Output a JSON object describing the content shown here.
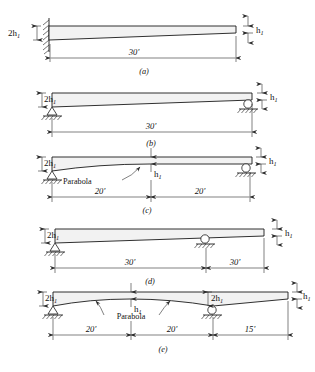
{
  "figure": {
    "depth_symbol_small": "h",
    "depth_symbol_small_sub": "1",
    "depth_symbol_double": "2h",
    "depth_symbol_double_sub": "1",
    "parabola_label": "Parabola",
    "colors": {
      "line": "#1a1a1a",
      "beam_fill": "#f2f2f2",
      "dimension": "#2b2b2b",
      "background": "#ffffff"
    }
  },
  "subfigures": [
    {
      "id": "a",
      "caption": "(a)",
      "support_left": "fixed-wall",
      "support_right": "none",
      "left_depth": "2h",
      "left_depth_sub": "1",
      "right_depth": "h",
      "right_depth_sub": "1",
      "profile": "linear-taper",
      "dimensions": [
        {
          "label": "30'",
          "span_feet": 30
        }
      ]
    },
    {
      "id": "b",
      "caption": "(b)",
      "support_left": "pin",
      "support_right": "roller",
      "left_depth": "2h",
      "left_depth_sub": "1",
      "right_depth": "h",
      "right_depth_sub": "1",
      "profile": "linear-taper",
      "dimensions": [
        {
          "label": "30'",
          "span_feet": 30
        }
      ]
    },
    {
      "id": "c",
      "caption": "(c)",
      "support_left": "pin",
      "support_right": "roller",
      "left_depth": "2h",
      "left_depth_sub": "1",
      "mid_depth": "h",
      "mid_depth_sub": "1",
      "right_depth": "h",
      "right_depth_sub": "1",
      "profile": "parabola-then-constant",
      "parabola_label": "Parabola",
      "dimensions": [
        {
          "label": "20'",
          "span_feet": 20
        },
        {
          "label": "20'",
          "span_feet": 20
        }
      ]
    },
    {
      "id": "d",
      "caption": "(d)",
      "support_left": "pin",
      "support_mid": "roller",
      "support_right": "none",
      "left_depth": "2h",
      "left_depth_sub": "1",
      "right_depth": "h",
      "right_depth_sub": "1",
      "profile": "linear-taper",
      "dimensions": [
        {
          "label": "30'",
          "span_feet": 30
        },
        {
          "label": "30'",
          "span_feet": 30
        }
      ]
    },
    {
      "id": "e",
      "caption": "(e)",
      "support_left": "pin",
      "support_mid": "roller",
      "support_right": "none",
      "left_depth": "2h",
      "left_depth_sub": "1",
      "mid_depth": "h",
      "mid_depth_sub": "1",
      "support_depth": "2h",
      "support_depth_sub": "1",
      "right_depth": "h",
      "right_depth_sub": "1",
      "profile": "double-parabola",
      "parabola_label": "Parabola",
      "dimensions": [
        {
          "label": "20'",
          "span_feet": 20
        },
        {
          "label": "20'",
          "span_feet": 20
        },
        {
          "label": "15'",
          "span_feet": 15
        }
      ]
    }
  ]
}
